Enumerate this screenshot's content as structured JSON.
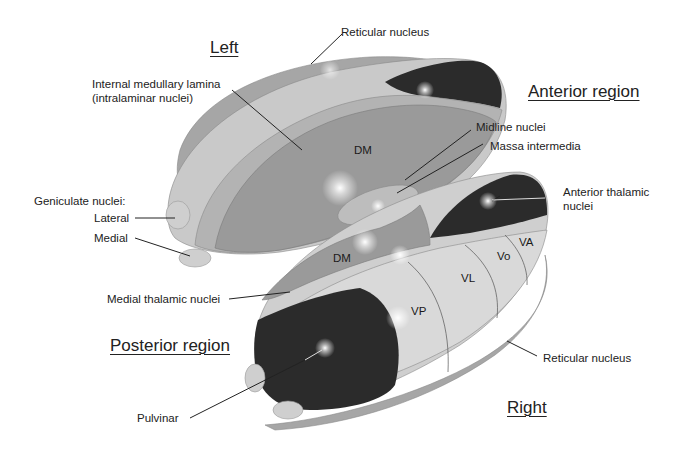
{
  "regions": {
    "left": "Left",
    "anterior": "Anterior region",
    "posterior": "Posterior region",
    "right": "Right"
  },
  "labels": {
    "reticular_top": "Reticular  nucleus",
    "internal_lamina_1": "Internal medullary lamina",
    "internal_lamina_2": "(intralaminar nuclei)",
    "midline": "Midline nuclei",
    "massa": "Massa intermedia",
    "geniculate": "Geniculate nuclei:",
    "lateral": "Lateral",
    "medial": "Medial",
    "anterior_thalamic_1": "Anterior thalamic",
    "anterior_thalamic_2": "nuclei",
    "medial_thalamic": "Medial thalamic nuclei",
    "pulvinar": "Pulvinar",
    "reticular_bottom": "Reticular nucleus"
  },
  "nuclei": {
    "dm_left": "DM",
    "dm_right": "DM",
    "vp": "VP",
    "vl": "VL",
    "vo": "Vo",
    "va": "VA"
  },
  "colors": {
    "dark_nucleus": "#2b2b2b",
    "medium_gray": "#9a9a9a",
    "light_gray": "#c9c9c9",
    "pale_gray": "#d6d6d6"
  }
}
